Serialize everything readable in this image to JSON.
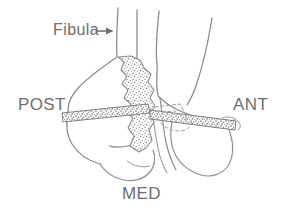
{
  "figure": {
    "background_color": "#ffffff",
    "line_color": "#8a8a8a",
    "label_color": "#6e6e6e",
    "stipple_color": "#9a9a9a",
    "width": 287,
    "height": 213
  },
  "labels": {
    "fibula": "Fibula",
    "posterior": "POST",
    "anterior": "ANT",
    "medial": "MED"
  },
  "annotations": {
    "fibula_arrow": "arrow-right",
    "fibula_arrow_direction": "right"
  },
  "structures": [
    {
      "name": "fibula-shaft",
      "description": "Narrow vertical bone shaft, left of center, upper region"
    },
    {
      "name": "tibia-shaft",
      "description": "Wide vertical bone shaft, right of center, upper region"
    },
    {
      "name": "posterior-malleolus",
      "description": "Rounded lobe at lower left labelled toward POST"
    },
    {
      "name": "medial-malleolus",
      "description": "Rounded lobe at lower center labelled toward MED"
    },
    {
      "name": "anterior-tubercle",
      "description": "Flared lobe at lower right toward ANT"
    },
    {
      "name": "fracture-fragment",
      "description": "Jagged stippled cancellous bone fragment, center"
    },
    {
      "name": "joint-line",
      "description": "Stippled diagonal band traversing the specimen"
    },
    {
      "name": "hidden-outline",
      "description": "Dashed lines indicating obscured margin near center right"
    }
  ]
}
